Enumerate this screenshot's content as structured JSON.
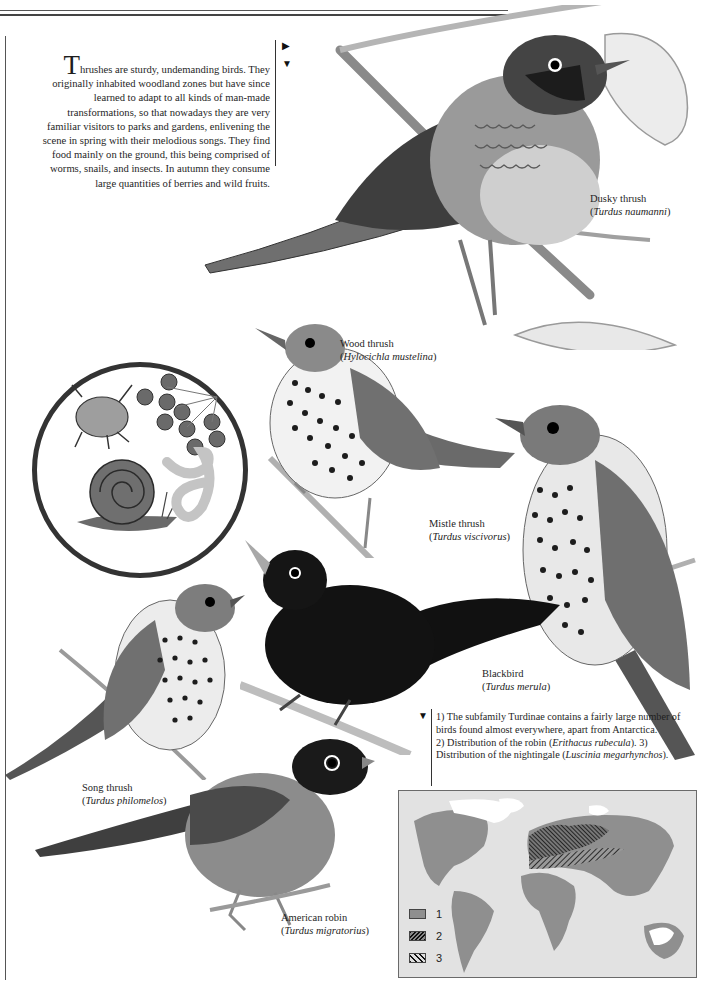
{
  "page": {
    "intro": {
      "dropcap": "T",
      "text": "hrushes are sturdy, undemanding birds. They originally inhabited woodland zones but have since learned to adapt to all kinds of man-made transformations, so that nowadays they are very familiar visitors to parks and gardens, enlivening the scene in spring with their melodious songs. They find food mainly on the ground, this being comprised of worms, snails, and insects. In autumn they consume large quantities of berries and wild fruits."
    },
    "markers": {
      "right_arrow": "▶",
      "down_arrow": "▼"
    },
    "inset": {
      "label": "diet items",
      "items": [
        "beetle",
        "berries",
        "snail",
        "worm"
      ]
    },
    "birds": [
      {
        "common": "Dusky thrush",
        "scientific": "Turdus naumanni"
      },
      {
        "common": "Wood thrush",
        "scientific": "Hylocichla mustelina"
      },
      {
        "common": "Mistle thrush",
        "scientific": "Turdus viscivorus"
      },
      {
        "common": "Blackbird",
        "scientific": "Turdus merula"
      },
      {
        "common": "Song thrush",
        "scientific": "Turdus philomelos"
      },
      {
        "common": "American robin",
        "scientific": "Turdus migratorius"
      }
    ],
    "notes": {
      "line1": "1) The subfamily Turdinae contains a fairly large number of birds found almost everywhere, apart from Antarctica.",
      "line2_pre": "2) Distribution of the robin (",
      "line2_sci": "Erithacus rubecula",
      "line2_post": "). 3) Distribution of the nightingale (",
      "line3_sci": "Luscinia megarhynchos",
      "line3_post": ")."
    },
    "map": {
      "legend": [
        {
          "num": "1",
          "pattern": "solid-gray",
          "meaning": "Turdinae range"
        },
        {
          "num": "2",
          "pattern": "dense-hatch",
          "meaning": "robin range"
        },
        {
          "num": "3",
          "pattern": "diagonal-hatch",
          "meaning": "nightingale range"
        }
      ],
      "colors": {
        "ocean": "#e2e2e2",
        "land": "#8f8f8f",
        "ice": "#ffffff",
        "hatch": "#222222"
      }
    }
  }
}
